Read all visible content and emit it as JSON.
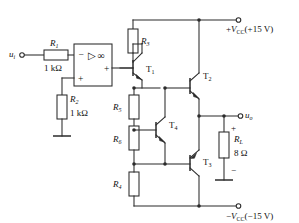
{
  "diagram": {
    "type": "circuit-schematic"
  },
  "input": {
    "source_label": "u",
    "source_sub": "i",
    "r1_label": "R",
    "r1_sub": "1",
    "r1_value": "1 kΩ"
  },
  "opamp": {
    "minus": "−",
    "plus_out": "+",
    "plus_in": "+",
    "triangle": "▷",
    "infinity": "∞"
  },
  "feedback": {
    "r2_label": "R",
    "r2_sub": "2",
    "r2_value": "1 kΩ"
  },
  "bias_chain": {
    "r3_label": "R",
    "r3_sub": "3",
    "r5_label": "R",
    "r5_sub": "5",
    "r6_label": "R",
    "r6_sub": "6",
    "r7_label": "R",
    "r7_sub": "4"
  },
  "transistors": {
    "t1_label": "T",
    "t1_sub": "1",
    "t2_label": "T",
    "t2_sub": "2",
    "t3_label": "T",
    "t3_sub": "3",
    "t4_label": "T",
    "t4_sub": "4"
  },
  "output": {
    "uo_label": "u",
    "uo_sub": "o",
    "rl_label": "R",
    "rl_sub": "L",
    "rl_value": "8 Ω",
    "plus_mark": "+",
    "minus_mark": "−"
  },
  "supply": {
    "pos_prefix": "+",
    "pos_symbol": "V",
    "pos_sub": "CC",
    "pos_value": "(+15 V)",
    "neg_prefix": "−",
    "neg_symbol": "V",
    "neg_sub": "CC",
    "neg_value": "(−15 V)"
  },
  "colors": {
    "wire": "#2b2b2b",
    "background": "#ffffff",
    "text": "#111111"
  }
}
